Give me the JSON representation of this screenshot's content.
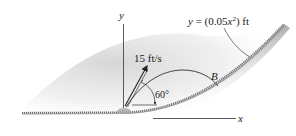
{
  "figure": {
    "equation_label": "y = (0.05x²) ft",
    "equation_parts": {
      "lhs": "y",
      "eq": " = (0.05",
      "var": "x",
      "sup": "2",
      "tail": ") ft"
    },
    "velocity_label": "15 ft/s",
    "angle_label": "60°",
    "point_label": "B",
    "x_axis_label": "x",
    "y_axis_label": "y"
  },
  "colors": {
    "line": "#333333",
    "ground_dark": "#6e6e6e",
    "ground_shadow": "#bdbdbd",
    "region_fill": "#d9d9d9"
  }
}
